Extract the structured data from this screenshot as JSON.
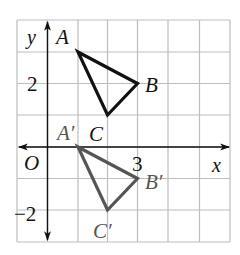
{
  "figure": {
    "axes": {
      "x_label": "x",
      "y_label": "y",
      "origin_label": "O",
      "tick_labels": [
        {
          "axis": "y",
          "value": "2"
        },
        {
          "axis": "y",
          "value": "−2"
        },
        {
          "axis": "x",
          "value": "3"
        }
      ],
      "x_range": [
        -1,
        6
      ],
      "y_range": [
        -3,
        4
      ]
    },
    "grid": {
      "color": "#bdbdbd",
      "vertical_x_px": [
        17,
        47.5,
        78,
        107.5,
        137.5,
        168,
        199.5,
        230
      ],
      "horizontal_y_px": [
        20,
        52,
        83.5,
        115,
        147,
        178.5,
        210,
        242
      ]
    },
    "triangles": [
      {
        "name": "ABC",
        "color": "#111111",
        "vertices": [
          {
            "label": "A",
            "x": 1,
            "y": 3
          },
          {
            "label": "B",
            "x": 3,
            "y": 2
          },
          {
            "label": "C",
            "x": 2,
            "y": 1
          }
        ]
      },
      {
        "name": "A'B'C'",
        "color": "#555555",
        "vertices": [
          {
            "label": "A′",
            "x": 1,
            "y": 0
          },
          {
            "label": "B′",
            "x": 3,
            "y": -1
          },
          {
            "label": "C′",
            "x": 2,
            "y": -2
          }
        ]
      }
    ]
  }
}
